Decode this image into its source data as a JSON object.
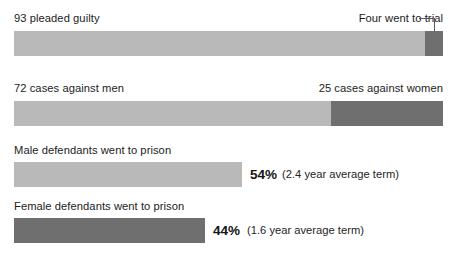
{
  "chart_data": {
    "type": "bar",
    "title": "",
    "subtitle": "",
    "xlabel": "",
    "ylabel": "",
    "grid": false,
    "legend": "none",
    "orientation": "horizontal",
    "rows": [
      {
        "id": "case-outcomes",
        "left_label": "93 pleaded guilty",
        "right_label": "Four went to trial",
        "has_leader_line": true,
        "segments": [
          {
            "name": "pleaded guilty",
            "value": 93,
            "shade": "light"
          },
          {
            "name": "went to trial",
            "value": 4,
            "shade": "dark"
          }
        ]
      },
      {
        "id": "cases-by-gender",
        "left_label": "72 cases against men",
        "right_label": "25 cases against women",
        "has_leader_line": false,
        "segments": [
          {
            "name": "cases against men",
            "value": 72,
            "shade": "light"
          },
          {
            "name": "cases against women",
            "value": 25,
            "shade": "dark"
          }
        ]
      },
      {
        "id": "male-prison",
        "left_label": "Male defendants went to prison",
        "right_label": "",
        "has_leader_line": false,
        "percent": "54%",
        "note": "(2.4 year average term)",
        "segments": [
          {
            "name": "male defendants went to prison",
            "value": 54,
            "shade": "light"
          }
        ]
      },
      {
        "id": "female-prison",
        "left_label": "Female defendants went to prison",
        "right_label": "",
        "has_leader_line": false,
        "percent": "44%",
        "note": "(1.6 year average term)",
        "segments": [
          {
            "name": "female defendants went to prison",
            "value": 44,
            "shade": "dark"
          }
        ]
      }
    ]
  },
  "colors": {
    "light_bar": "#b9b9b9",
    "dark_bar": "#6f6f6f",
    "text": "#1c1c1c",
    "leader_line": "#59595b",
    "background": "#ffffff"
  }
}
